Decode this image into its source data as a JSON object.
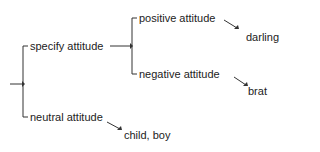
{
  "diagram": {
    "type": "tree",
    "root_arrow": "→",
    "nodes": {
      "specify": "specify attitude",
      "positive": "positive attitude",
      "darling": "darling",
      "negative": "negative attitude",
      "brat": "brat",
      "neutral": "neutral attitude",
      "child_boy": "child, boy"
    },
    "colors": {
      "line": "#333333",
      "text": "#222222"
    }
  }
}
